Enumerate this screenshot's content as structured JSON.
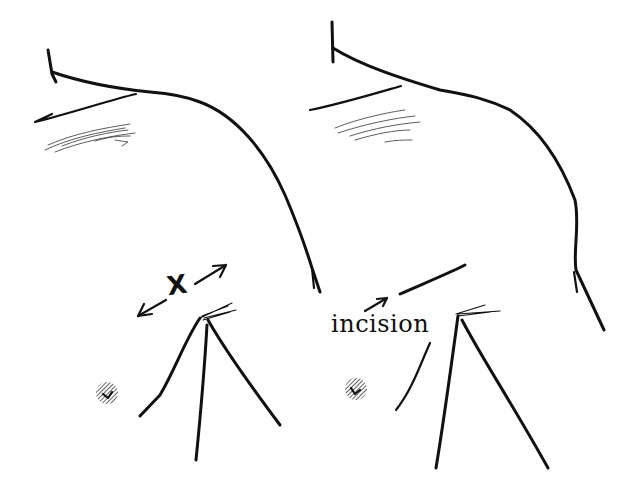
{
  "figure": {
    "panels": [
      {
        "id": "left",
        "description": "Shoulder and axilla outline with measurement arrows",
        "labels": {
          "measure": "X"
        },
        "annotations": [
          "double-headed-arrow"
        ]
      },
      {
        "id": "right",
        "description": "Shoulder and axilla outline with incision line marked",
        "labels": {
          "incision": "incision"
        },
        "annotations": [
          "pointer-arrow",
          "incision-line"
        ]
      }
    ],
    "colors": {
      "ink": "#111111",
      "background": "#ffffff"
    }
  }
}
